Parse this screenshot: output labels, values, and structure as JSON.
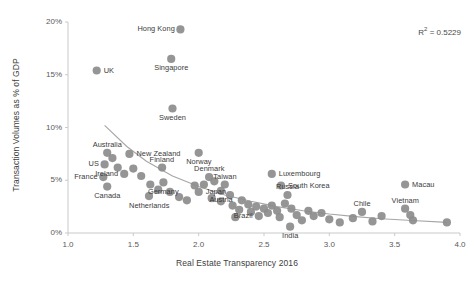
{
  "chart_data": {
    "type": "scatter",
    "title": "",
    "xlabel": "Real Estate Transparency 2016",
    "ylabel": "Transaction Volumes as % of GDP",
    "xlim": [
      1.0,
      4.0
    ],
    "ylim": [
      0,
      20
    ],
    "xticks": [
      "1.0",
      "1.5",
      "2.0",
      "2.5",
      "3.0",
      "3.5",
      "4.0"
    ],
    "yticks": [
      "0%",
      "5%",
      "10%",
      "15%",
      "20%"
    ],
    "grid": false,
    "legend": "none",
    "annotation": "R2 = 0.5229",
    "annotation_prefix": "R",
    "annotation_sup": "2",
    "annotation_suffix": " = 0.5229",
    "r_squared": 0.5229,
    "marker_color": "#8c8c8c",
    "trendline_color": "#a6a6a6",
    "trendline": {
      "type": "power-fit",
      "points": [
        [
          1.28,
          10.2
        ],
        [
          1.45,
          8.2
        ],
        [
          1.6,
          6.8
        ],
        [
          1.8,
          5.4
        ],
        [
          2.0,
          4.4
        ],
        [
          2.2,
          3.6
        ],
        [
          2.4,
          3.0
        ],
        [
          2.6,
          2.5
        ],
        [
          2.8,
          2.1
        ],
        [
          3.0,
          1.8
        ],
        [
          3.2,
          1.55
        ],
        [
          3.4,
          1.35
        ],
        [
          3.6,
          1.2
        ],
        [
          3.9,
          1.0
        ]
      ]
    },
    "points": [
      {
        "label": "Hong Kong",
        "x": 1.86,
        "y": 19.3,
        "lpos": "left"
      },
      {
        "label": "Singapore",
        "x": 1.79,
        "y": 16.5,
        "lpos": "below"
      },
      {
        "label": "UK",
        "x": 1.22,
        "y": 15.4,
        "lpos": "right"
      },
      {
        "label": "Sweden",
        "x": 1.8,
        "y": 11.8,
        "lpos": "below"
      },
      {
        "label": "Australia",
        "x": 1.3,
        "y": 7.6,
        "lpos": "above"
      },
      {
        "label": "New Zealand",
        "x": 1.47,
        "y": 7.5,
        "lpos": "right"
      },
      {
        "label": "Norway",
        "x": 2.0,
        "y": 7.6,
        "lpos": "below"
      },
      {
        "label": "US",
        "x": 1.28,
        "y": 6.5,
        "lpos": "left"
      },
      {
        "label": "Finland",
        "x": 1.72,
        "y": 6.2,
        "lpos": "above"
      },
      {
        "label": "Ireland",
        "x": 1.43,
        "y": 5.6,
        "lpos": "left"
      },
      {
        "label": "France",
        "x": 1.27,
        "y": 5.3,
        "lpos": "left"
      },
      {
        "label": "Denmark",
        "x": 2.08,
        "y": 5.3,
        "lpos": "above"
      },
      {
        "label": "Germany",
        "x": 1.73,
        "y": 4.8,
        "lpos": "below"
      },
      {
        "label": "Luxembourg",
        "x": 2.56,
        "y": 5.6,
        "lpos": "right"
      },
      {
        "label": "Macau",
        "x": 3.58,
        "y": 4.6,
        "lpos": "right"
      },
      {
        "label": "Taiwan",
        "x": 2.2,
        "y": 4.6,
        "lpos": "above"
      },
      {
        "label": "South Korea",
        "x": 2.63,
        "y": 4.5,
        "lpos": "right"
      },
      {
        "label": "Canada",
        "x": 1.3,
        "y": 4.4,
        "lpos": "below"
      },
      {
        "label": "Japan",
        "x": 2.0,
        "y": 3.9,
        "lpos": "right"
      },
      {
        "label": "Austria",
        "x": 2.17,
        "y": 4.0,
        "lpos": "below"
      },
      {
        "label": "Russia",
        "x": 2.68,
        "y": 3.6,
        "lpos": "above"
      },
      {
        "label": "Netherlands",
        "x": 1.62,
        "y": 3.5,
        "lpos": "below"
      },
      {
        "label": "Vietnam",
        "x": 3.58,
        "y": 2.3,
        "lpos": "above"
      },
      {
        "label": "Chile",
        "x": 3.25,
        "y": 2.0,
        "lpos": "above"
      },
      {
        "label": "Brazil",
        "x": 2.46,
        "y": 1.6,
        "lpos": "left"
      },
      {
        "label": "India",
        "x": 2.7,
        "y": 0.6,
        "lpos": "below"
      },
      {
        "label": "",
        "x": 1.5,
        "y": 6.1
      },
      {
        "label": "",
        "x": 1.56,
        "y": 5.4
      },
      {
        "label": "",
        "x": 1.34,
        "y": 7.1
      },
      {
        "label": "",
        "x": 1.38,
        "y": 6.2
      },
      {
        "label": "",
        "x": 1.63,
        "y": 4.6
      },
      {
        "label": "",
        "x": 1.69,
        "y": 4.1
      },
      {
        "label": "",
        "x": 1.78,
        "y": 3.9
      },
      {
        "label": "",
        "x": 1.85,
        "y": 3.4
      },
      {
        "label": "",
        "x": 1.91,
        "y": 3.1
      },
      {
        "label": "",
        "x": 1.97,
        "y": 4.5
      },
      {
        "label": "",
        "x": 2.04,
        "y": 4.6
      },
      {
        "label": "",
        "x": 2.12,
        "y": 4.9
      },
      {
        "label": "",
        "x": 2.1,
        "y": 3.3
      },
      {
        "label": "",
        "x": 2.17,
        "y": 3.0
      },
      {
        "label": "",
        "x": 2.24,
        "y": 3.6
      },
      {
        "label": "",
        "x": 2.26,
        "y": 2.6
      },
      {
        "label": "",
        "x": 2.31,
        "y": 2.2
      },
      {
        "label": "",
        "x": 2.33,
        "y": 3.1
      },
      {
        "label": "",
        "x": 2.38,
        "y": 2.7
      },
      {
        "label": "",
        "x": 2.4,
        "y": 2.0
      },
      {
        "label": "",
        "x": 2.44,
        "y": 2.5
      },
      {
        "label": "",
        "x": 2.5,
        "y": 2.3
      },
      {
        "label": "",
        "x": 2.53,
        "y": 1.9
      },
      {
        "label": "",
        "x": 2.56,
        "y": 2.6
      },
      {
        "label": "",
        "x": 2.6,
        "y": 2.1
      },
      {
        "label": "",
        "x": 2.62,
        "y": 1.5
      },
      {
        "label": "",
        "x": 2.66,
        "y": 2.8
      },
      {
        "label": "",
        "x": 2.71,
        "y": 2.3
      },
      {
        "label": "",
        "x": 2.75,
        "y": 1.7
      },
      {
        "label": "",
        "x": 2.79,
        "y": 1.2
      },
      {
        "label": "",
        "x": 2.84,
        "y": 2.1
      },
      {
        "label": "",
        "x": 2.88,
        "y": 1.6
      },
      {
        "label": "",
        "x": 2.94,
        "y": 1.9
      },
      {
        "label": "",
        "x": 3.0,
        "y": 1.3
      },
      {
        "label": "",
        "x": 3.08,
        "y": 1.0
      },
      {
        "label": "",
        "x": 3.18,
        "y": 1.4
      },
      {
        "label": "",
        "x": 3.33,
        "y": 1.1
      },
      {
        "label": "",
        "x": 3.4,
        "y": 1.6
      },
      {
        "label": "",
        "x": 3.62,
        "y": 1.7
      },
      {
        "label": "",
        "x": 3.64,
        "y": 1.2
      },
      {
        "label": "",
        "x": 3.9,
        "y": 1.0
      },
      {
        "label": "",
        "x": 2.28,
        "y": 1.5
      }
    ]
  }
}
